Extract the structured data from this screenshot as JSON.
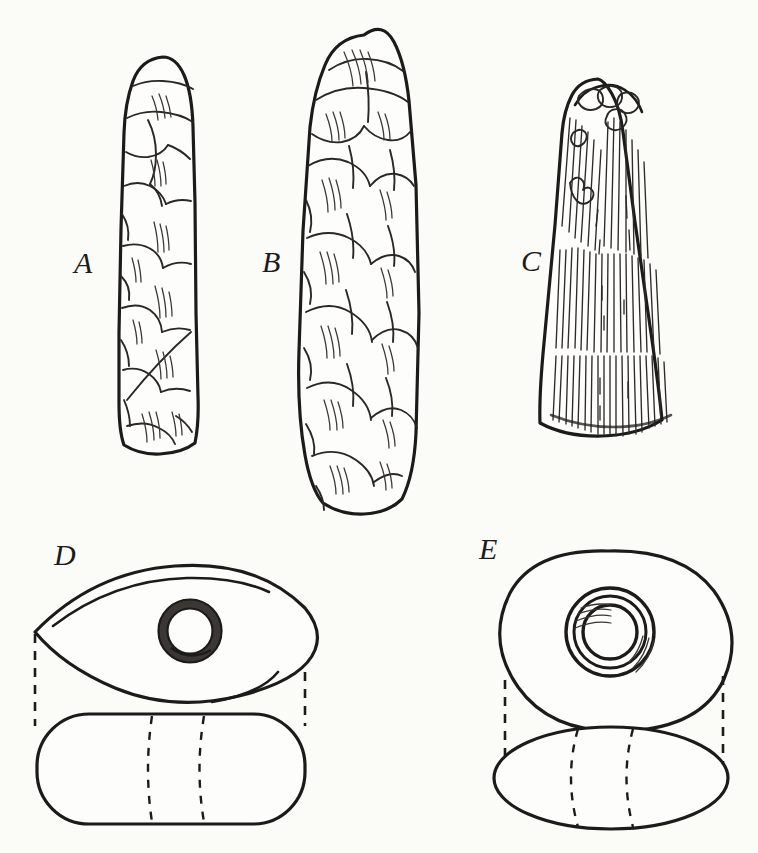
{
  "plate": {
    "title": "Stone celts and perforated stone implements",
    "background_color": "#fbfbf8",
    "ink_color": "#1d1b19",
    "technique": "pen-and-ink line engraving",
    "figure_count": 5
  },
  "figures": [
    {
      "id": "A",
      "label": "A",
      "name": "chipped-stone-celt-narrow",
      "description": "Narrow elongated chipped flint celt, rounded poll, flake-scar facets over entire surface",
      "shading": "flake scars with fine hatching",
      "bounds": {
        "x": 123,
        "y": 56,
        "width": 80,
        "height": 400
      }
    },
    {
      "id": "B",
      "label": "B",
      "name": "chipped-stone-celt-broad",
      "description": "Broad ovate chipped flint celt, rounded poll and rounded bit, deep flake scars",
      "shading": "large flake scars with parallel hatching",
      "bounds": {
        "x": 305,
        "y": 34,
        "width": 112,
        "height": 478
      }
    },
    {
      "id": "C",
      "label": "C",
      "name": "polished-stone-celt",
      "description": "Ground and polished stone celt, pecked battered poll, vertical striations, flaring bit",
      "shading": "vertical striation lines",
      "bounds": {
        "x": 551,
        "y": 78,
        "width": 122,
        "height": 375
      }
    },
    {
      "id": "D",
      "label": "D",
      "name": "perforated-stone-pointed-oval",
      "views": [
        "plan-view",
        "side-elevation"
      ],
      "description": "Pointed-oval (lenticular) perforated stone, plan view above with drilled central hole, rounded-rectangular side elevation below",
      "shading": "dark ring around the drilled perforation",
      "bounds": {
        "x": 33,
        "y": 556,
        "width": 280,
        "height": 275
      }
    },
    {
      "id": "E",
      "label": "E",
      "name": "perforated-stone-discoidal",
      "views": [
        "plan-view",
        "side-elevation"
      ],
      "description": "Discoidal perforated stone, plan view above with concentric drilled hole, lenticular side elevation below",
      "shading": "concentric rings with arc hatching at the bore",
      "bounds": {
        "x": 456,
        "y": 548,
        "width": 270,
        "height": 282
      }
    }
  ],
  "annotations": {
    "projection_lines": "dashed vertical projection lines connect plan views to side elevations for figures D and E",
    "hidden_lines": "dashed curves in the side elevations indicate the hidden walls of the perforation"
  }
}
